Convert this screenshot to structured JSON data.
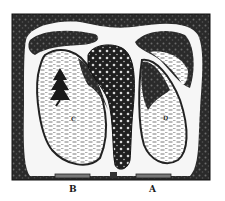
{
  "diagram": {
    "type": "garden-plan",
    "style": "vintage engraving",
    "colors": {
      "ink": "#1a1a1a",
      "paper": "#ffffff",
      "path": "#f4f4f4"
    },
    "labels": {
      "c": "C",
      "d": "D",
      "b": "B",
      "a": "A"
    },
    "regions": [
      {
        "id": "C",
        "description": "left oval lawn with tree"
      },
      {
        "id": "D",
        "description": "right oval lawn"
      },
      {
        "id": "center",
        "description": "elongated shrubbery bed"
      },
      {
        "id": "B",
        "description": "left entrance"
      },
      {
        "id": "A",
        "description": "right entrance"
      }
    ]
  }
}
